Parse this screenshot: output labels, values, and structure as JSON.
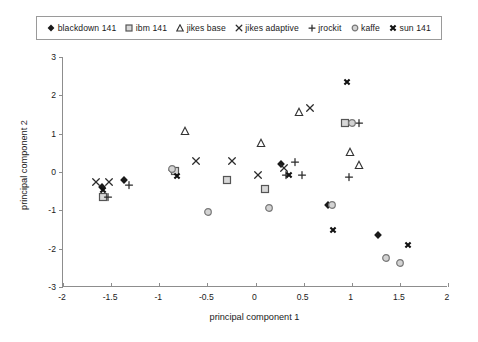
{
  "chart_data": {
    "type": "scatter",
    "title": "",
    "xlabel": "principal component 1",
    "ylabel": "principal component 2",
    "xlim": [
      -2,
      2
    ],
    "ylim": [
      -3,
      3
    ],
    "xticks": [
      "-2",
      "-1.5",
      "-1",
      "-0.5",
      "0",
      "0.5",
      "1",
      "1.5",
      "2"
    ],
    "xtick_values": [
      -2,
      -1.5,
      -1,
      -0.5,
      0,
      0.5,
      1,
      1.5,
      2
    ],
    "yticks": [
      "-3",
      "-2",
      "-1",
      "0",
      "1",
      "2",
      "3"
    ],
    "ytick_values": [
      -3,
      -2,
      -1,
      0,
      1,
      2,
      3
    ],
    "grid": false,
    "legend_position": "top",
    "series": [
      {
        "name": "blackdown 141",
        "marker": "filled-diamond",
        "color": "#1a1a1a",
        "points": [
          [
            -1.59,
            -0.39
          ],
          [
            -1.37,
            -0.22
          ],
          [
            -0.87,
            0.06
          ],
          [
            0.26,
            0.22
          ],
          [
            0.75,
            -0.86
          ],
          [
            1.27,
            -1.65
          ]
        ]
      },
      {
        "name": "ibm 141",
        "marker": "open-square",
        "color": "#555555",
        "points": [
          [
            -1.58,
            -0.66
          ],
          [
            -0.84,
            0.02
          ],
          [
            -0.3,
            -0.22
          ],
          [
            0.1,
            -0.44
          ],
          [
            0.93,
            1.27
          ]
        ]
      },
      {
        "name": "jikes base",
        "marker": "open-triangle",
        "color": "#333333",
        "points": [
          [
            -0.73,
            1.07
          ],
          [
            0.06,
            0.76
          ],
          [
            0.45,
            1.57
          ],
          [
            0.98,
            0.53
          ],
          [
            1.08,
            0.19
          ]
        ]
      },
      {
        "name": "jikes adaptive",
        "marker": "x-cross",
        "color": "#2b2b2b",
        "points": [
          [
            -1.66,
            -0.27
          ],
          [
            -1.52,
            -0.27
          ],
          [
            -0.62,
            0.3
          ],
          [
            -0.24,
            0.29
          ],
          [
            0.03,
            -0.07
          ],
          [
            0.3,
            0.1
          ],
          [
            0.57,
            1.66
          ]
        ]
      },
      {
        "name": "jrockit",
        "marker": "plus",
        "color": "#2b2b2b",
        "points": [
          [
            -1.53,
            -0.64
          ],
          [
            -1.31,
            -0.34
          ],
          [
            0.32,
            -0.08
          ],
          [
            0.41,
            0.25
          ],
          [
            0.48,
            -0.08
          ],
          [
            0.97,
            -0.12
          ],
          [
            1.08,
            1.27
          ]
        ]
      },
      {
        "name": "kaffe",
        "marker": "open-circle",
        "color": "#777777",
        "points": [
          [
            -0.87,
            0.09
          ],
          [
            -0.49,
            -1.04
          ],
          [
            0.14,
            -0.95
          ],
          [
            0.79,
            -0.87
          ],
          [
            1.0,
            1.27
          ],
          [
            1.36,
            -2.25
          ],
          [
            1.5,
            -2.37
          ]
        ]
      },
      {
        "name": "sun 141",
        "marker": "bold-x",
        "color": "#111111",
        "points": [
          [
            -1.58,
            -0.46
          ],
          [
            -0.82,
            -0.1
          ],
          [
            0.35,
            -0.08
          ],
          [
            0.8,
            -1.5
          ],
          [
            0.95,
            2.35
          ],
          [
            1.58,
            -1.9
          ]
        ]
      }
    ]
  },
  "legend": {
    "items": [
      {
        "label": "blackdown 141",
        "marker": "filled-diamond"
      },
      {
        "label": "ibm 141",
        "marker": "open-square"
      },
      {
        "label": "jikes base",
        "marker": "open-triangle"
      },
      {
        "label": "jikes adaptive",
        "marker": "x-cross"
      },
      {
        "label": "jrockit",
        "marker": "plus"
      },
      {
        "label": "kaffe",
        "marker": "open-circle"
      },
      {
        "label": "sun 141",
        "marker": "bold-x"
      }
    ]
  }
}
